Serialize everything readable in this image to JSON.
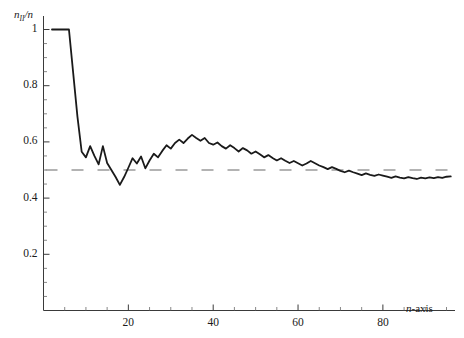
{
  "chart_data": {
    "type": "line",
    "title": "",
    "subtitle": "",
    "xlabel": "n-axis",
    "ylabel": "n_II/n",
    "ylabel_base": "n",
    "ylabel_sub": "II",
    "ylabel_tail": "/n",
    "xlim": [
      0,
      97
    ],
    "ylim": [
      0,
      1.06
    ],
    "grid": false,
    "legend": false,
    "legend_position": "none",
    "xticks": [
      20,
      40,
      60,
      80
    ],
    "xtick_labels": [
      "20",
      "40",
      "60",
      "80"
    ],
    "yticks": [
      0.2,
      0.4,
      0.6,
      0.8,
      1
    ],
    "ytick_labels": [
      "0.2",
      "0.4",
      "0.6",
      "0.8",
      "1"
    ],
    "x_minor_step": 5,
    "y_minor_step": 0.05,
    "series": [
      {
        "name": "n_II/n ratio",
        "color": "#1a1a1a",
        "style": "solid",
        "width": 1.8,
        "x": [
          2,
          3,
          4,
          5,
          6,
          7,
          8,
          9,
          10,
          11,
          12,
          13,
          14,
          15,
          16,
          17,
          18,
          19,
          20,
          21,
          22,
          23,
          24,
          25,
          26,
          27,
          28,
          29,
          30,
          31,
          32,
          33,
          34,
          35,
          36,
          37,
          38,
          39,
          40,
          41,
          42,
          43,
          44,
          45,
          46,
          47,
          48,
          49,
          50,
          51,
          52,
          53,
          54,
          55,
          56,
          57,
          58,
          59,
          60,
          61,
          62,
          63,
          64,
          65,
          66,
          67,
          68,
          69,
          70,
          71,
          72,
          73,
          74,
          75,
          76,
          77,
          78,
          79,
          80,
          81,
          82,
          83,
          84,
          85,
          86,
          87,
          88,
          89,
          90,
          91,
          92,
          93,
          94,
          95,
          96
        ],
        "y": [
          1.0,
          1.0,
          1.0,
          1.0,
          1.0,
          0.845,
          0.69,
          0.565,
          0.545,
          0.585,
          0.55,
          0.52,
          0.585,
          0.525,
          0.5,
          0.475,
          0.447,
          0.475,
          0.508,
          0.542,
          0.523,
          0.548,
          0.506,
          0.534,
          0.558,
          0.545,
          0.568,
          0.588,
          0.576,
          0.596,
          0.608,
          0.596,
          0.612,
          0.625,
          0.614,
          0.604,
          0.614,
          0.596,
          0.59,
          0.598,
          0.585,
          0.576,
          0.588,
          0.578,
          0.566,
          0.578,
          0.57,
          0.558,
          0.566,
          0.556,
          0.545,
          0.553,
          0.543,
          0.534,
          0.542,
          0.533,
          0.525,
          0.532,
          0.524,
          0.516,
          0.523,
          0.532,
          0.524,
          0.516,
          0.51,
          0.503,
          0.51,
          0.504,
          0.497,
          0.492,
          0.498,
          0.492,
          0.487,
          0.482,
          0.488,
          0.483,
          0.479,
          0.484,
          0.48,
          0.476,
          0.472,
          0.477,
          0.473,
          0.47,
          0.475,
          0.471,
          0.468,
          0.473,
          0.47,
          0.474,
          0.471,
          0.475,
          0.472,
          0.476,
          0.477
        ]
      }
    ],
    "reference_lines": [
      {
        "name": "half-level",
        "orientation": "horizontal",
        "value": 0.5,
        "color": "#9a9a9a",
        "style": "dashed"
      }
    ]
  }
}
